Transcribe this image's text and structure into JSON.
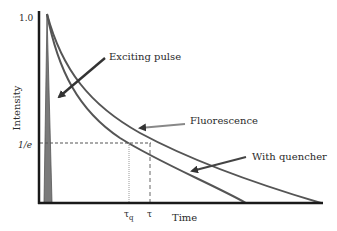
{
  "diagram": {
    "axes": {
      "y_label": "Intensity",
      "x_label": "Time",
      "y_ticks": [
        "1.0",
        "1/e"
      ],
      "x_ticks": [
        "τq",
        "τ"
      ]
    },
    "annotations": {
      "pulse": "Exciting pulse",
      "fluorescence": "Fluorescence",
      "quencher": "With quencher"
    },
    "tau_q_base": "τ",
    "tau_q_sub": "q",
    "colors": {
      "axis": "#1a1a1a",
      "curve": "#555555",
      "pulse_fill": "#777777",
      "arrow": "#333333",
      "reference_line": "#555555"
    }
  }
}
